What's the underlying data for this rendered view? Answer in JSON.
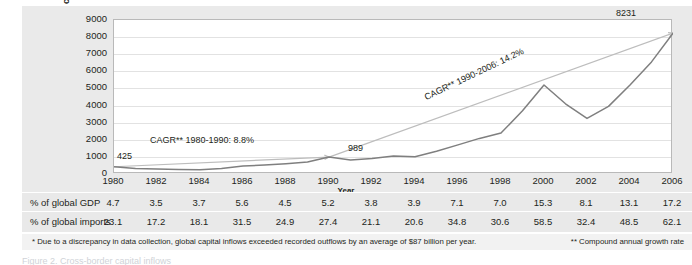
{
  "chart_data": {
    "type": "line",
    "title": "",
    "xlabel": "Year",
    "ylabel_lines": [
      "Total cross-border",
      "capital inflows* $ billion,",
      "constant 2006 exchange rates"
    ],
    "ylim": [
      0,
      9000
    ],
    "yticks": [
      9000,
      8000,
      7000,
      6000,
      5000,
      4000,
      3000,
      2000,
      1000,
      0
    ],
    "grid": true,
    "legend": "none",
    "x": [
      1980,
      1981,
      1982,
      1983,
      1984,
      1985,
      1986,
      1987,
      1988,
      1989,
      1990,
      1991,
      1992,
      1993,
      1994,
      1995,
      1996,
      1997,
      1998,
      1999,
      2000,
      2001,
      2002,
      2003,
      2004,
      2005,
      2006
    ],
    "xticks": [
      "1980",
      "1982",
      "1984",
      "1986",
      "1988",
      "1990",
      "1992",
      "1994",
      "1996",
      "1998",
      "2000",
      "2002",
      "2004",
      "2006"
    ],
    "series": [
      {
        "name": "Total cross-border capital inflows",
        "color": "#7f7f7f",
        "values": [
          425,
          330,
          300,
          265,
          250,
          330,
          460,
          520,
          600,
          700,
          989,
          810,
          900,
          1060,
          1010,
          1330,
          1700,
          2080,
          2390,
          3700,
          5200,
          4100,
          3250,
          3950,
          5200,
          6550,
          8231
        ]
      }
    ],
    "trend_lines": [
      {
        "name": "CAGR 1980-1990",
        "from_x": 1980,
        "from_y": 425,
        "to_x": 1990,
        "to_y": 989,
        "color": "#bdbdbd"
      },
      {
        "name": "CAGR 1990-2006",
        "from_x": 1990,
        "from_y": 989,
        "to_x": 2006,
        "to_y": 8231,
        "color": "#bdbdbd"
      }
    ],
    "annotations": [
      {
        "name": "cagr-1980-1990",
        "text": "CAGR** 1980-1990: 8.8%"
      },
      {
        "name": "cagr-1990-2006",
        "text": "CAGR** 1990-2006: 14.2%"
      }
    ],
    "data_labels": [
      {
        "name": "value-1980",
        "text": "425"
      },
      {
        "name": "value-1990",
        "text": "989"
      },
      {
        "name": "value-2006",
        "text": "8231"
      }
    ]
  },
  "table": {
    "rows": [
      {
        "label": "% of global GDP",
        "values": [
          "4.7",
          "3.5",
          "3.7",
          "5.6",
          "4.5",
          "5.2",
          "3.8",
          "3.9",
          "7.1",
          "7.0",
          "15.3",
          "8.1",
          "13.1",
          "17.2"
        ]
      },
      {
        "label": "% of global imports",
        "values": [
          "23.1",
          "17.2",
          "18.1",
          "31.5",
          "24.9",
          "27.4",
          "21.1",
          "20.6",
          "34.8",
          "30.6",
          "58.5",
          "32.4",
          "48.5",
          "62.1"
        ]
      }
    ]
  },
  "footnotes": {
    "left": "* Due to a discrepancy in data collection, global capital inflows exceeded recorded outflows by an average of $87 billion per year.",
    "right": "** Compound annual growth rate"
  },
  "cutoff_text": "Figure 2.  Cross-border capital inflows"
}
